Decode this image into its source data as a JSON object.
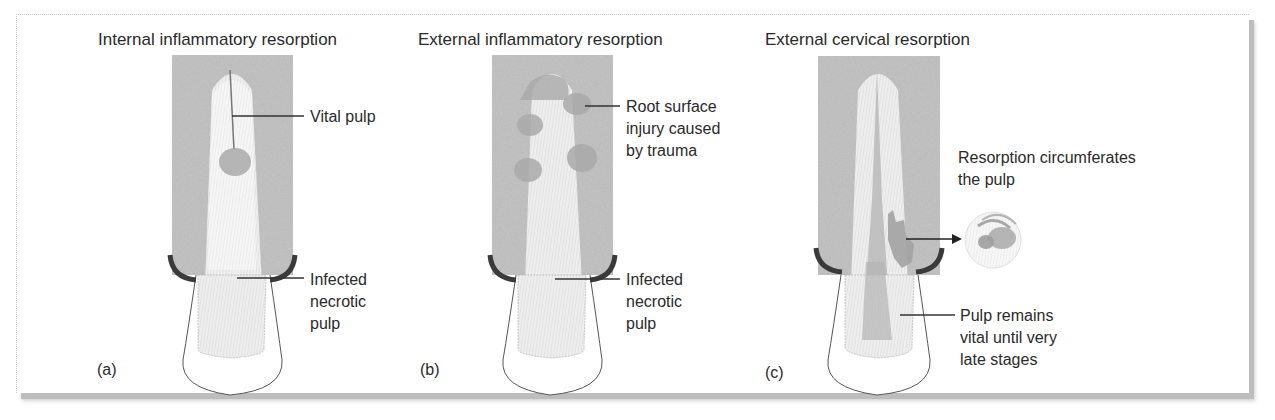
{
  "figure": {
    "panels": [
      {
        "id": "a",
        "title": "Internal inflammatory resorption",
        "tag": "(a)",
        "labels": [
          {
            "name": "vital-pulp-label",
            "lines": [
              "Vital pulp"
            ]
          },
          {
            "name": "infected-necrotic-pulp-label",
            "lines": [
              "Infected",
              "necrotic",
              "pulp"
            ]
          }
        ]
      },
      {
        "id": "b",
        "title": "External inflammatory resorption",
        "tag": "(b)",
        "labels": [
          {
            "name": "root-surface-injury-label",
            "lines": [
              "Root surface",
              "injury caused",
              "by trauma"
            ]
          },
          {
            "name": "infected-necrotic-pulp-label",
            "lines": [
              "Infected",
              "necrotic",
              "pulp"
            ]
          }
        ]
      },
      {
        "id": "c",
        "title": "External cervical resorption",
        "tag": "(c)",
        "labels": [
          {
            "name": "resorption-circumferates-label",
            "lines": [
              "Resorption circumferates",
              "the pulp"
            ]
          },
          {
            "name": "pulp-remains-vital-label",
            "lines": [
              "Pulp remains",
              "vital until very",
              "late stages"
            ]
          }
        ]
      }
    ]
  },
  "colors": {
    "bone": "#b9b9b9",
    "root": "#e9e9e9",
    "pulp": "#f6f6f6",
    "resorption": "#a9a9a9",
    "gingiva": "#3a3a3a",
    "text": "#2a2a2a"
  }
}
